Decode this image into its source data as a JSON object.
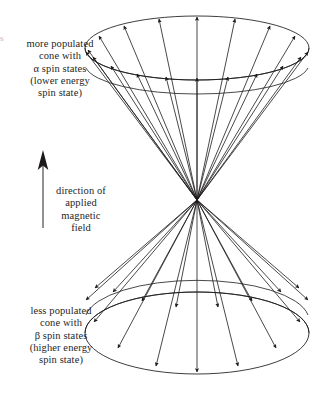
{
  "diagram": {
    "background_color": "#ffffff",
    "ink_color": "#221f1f",
    "edge_artifact": "s"
  },
  "labels": {
    "upper_cone": {
      "name": "alpha-spin-cone-label",
      "lines": [
        "more populated",
        "cone with",
        "α spin states",
        "(lower energy",
        "spin state)"
      ]
    },
    "lower_cone": {
      "name": "beta-spin-cone-label",
      "lines": [
        "less populated",
        "cone with",
        "β spin states",
        "(higher energy",
        "spin state)"
      ]
    },
    "field_direction": {
      "name": "field-direction-label",
      "lines": [
        "direction of",
        "applied",
        "magnetic",
        "field"
      ]
    }
  },
  "geometry": {
    "apex": {
      "x": 197,
      "y": 200
    },
    "upper_cone": {
      "far_rim": {
        "cx": 197,
        "cy": 48,
        "rx": 112,
        "ry": 32
      },
      "near_rim": {
        "cx": 197,
        "cy": 68,
        "rx": 112,
        "ry": 32
      },
      "vector_count_far": 9,
      "vector_count_near": 10,
      "arrow_direction": "outward-up"
    },
    "lower_cone": {
      "near_rim": {
        "cx": 197,
        "cy": 333,
        "rx": 112,
        "ry": 41
      },
      "far_rim": {
        "cx": 197,
        "cy": 318,
        "rx": 112,
        "ry": 41
      },
      "vector_count_near": 9,
      "vector_count_far": 9,
      "arrow_direction": "outward-down"
    },
    "field_arrow": {
      "x": 43,
      "y_tail": 228,
      "y_head": 152,
      "direction": "up"
    }
  }
}
